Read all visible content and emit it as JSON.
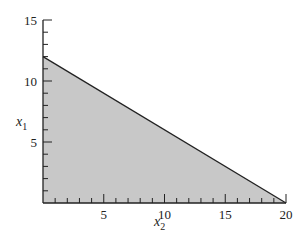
{
  "chart_data": {
    "type": "area",
    "title": "",
    "xlabel": "x2",
    "ylabel": "x1",
    "x_ticks": [
      5,
      10,
      15,
      20
    ],
    "y_ticks": [
      5,
      10,
      15
    ],
    "xlim": [
      0,
      20
    ],
    "ylim": [
      0,
      15
    ],
    "minor_tick_step": 1,
    "grid": false,
    "legend": null,
    "series": [
      {
        "name": "feasible region",
        "kind": "shaded polygon",
        "boundary_line": {
          "x": [
            0,
            20
          ],
          "y": [
            12,
            0
          ]
        },
        "polygon": [
          [
            0,
            0
          ],
          [
            0,
            12
          ],
          [
            20,
            0
          ]
        ],
        "fill_color": "#c8c8c8",
        "line_color": "#222222"
      }
    ]
  },
  "labels": {
    "x_axis": {
      "main": "x",
      "sub": "2"
    },
    "y_axis": {
      "main": "x",
      "sub": "1"
    },
    "x_tick_labels": [
      "5",
      "10",
      "15",
      "20"
    ],
    "y_tick_labels": [
      "5",
      "10",
      "15"
    ]
  },
  "colors": {
    "fill": "#c8c8c8",
    "axis": "#222222",
    "background": "#ffffff"
  }
}
